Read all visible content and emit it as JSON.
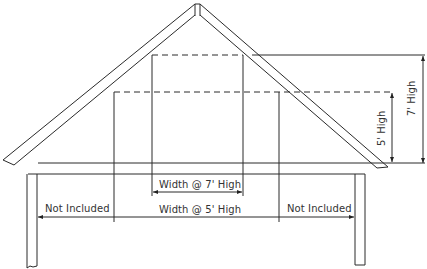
{
  "diagram": {
    "type": "attic cross-section",
    "labels": {
      "width_7ft": "Width @ 7' High",
      "width_5ft": "Width @ 5' High",
      "not_included_left": "Not Included",
      "not_included_right": "Not Included",
      "height_5ft": "5' High",
      "height_7ft": "7' High"
    },
    "colors": {
      "line": "#2a2a2a",
      "background": "#ffffff"
    }
  }
}
